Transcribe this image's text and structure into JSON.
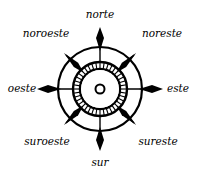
{
  "diagram": {
    "type": "compass-rose",
    "colors": {
      "ink": "#000000",
      "background": "#ffffff"
    },
    "center": {
      "x": 100,
      "y": 89
    },
    "labels": {
      "norte": "norte",
      "noreste": "noreste",
      "este": "este",
      "sureste": "sureste",
      "sur": "sur",
      "suroeste": "suroeste",
      "oeste": "oeste",
      "noroeste": "noroeste"
    }
  }
}
